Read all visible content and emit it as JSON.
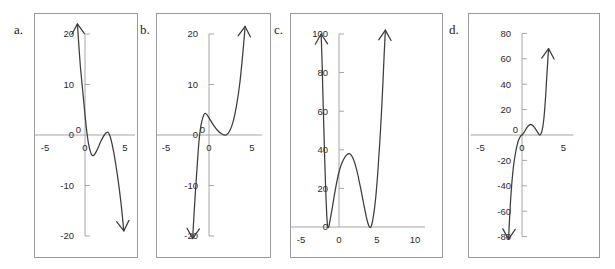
{
  "figure": {
    "background": "#ffffff",
    "curve_color": "#3d3d3d",
    "axis_color": "#a6a6a6",
    "frame_color": "#9a9a9a",
    "ghost_text": ". . . .  .  .   .    .     ."
  },
  "panels": [
    {
      "letter": "a.",
      "name": "panel-a",
      "frame": {
        "x": 34,
        "y": 13,
        "w": 104,
        "h": 245
      },
      "chart_data": {
        "type": "line",
        "title": "",
        "xlabel": "",
        "ylabel": "",
        "xlim": [
          -6.2,
          6.2
        ],
        "ylim": [
          -24,
          24
        ],
        "grid": false,
        "legend": "none",
        "xticks": [
          -5,
          0,
          5
        ],
        "xtick_labels": [
          "-5",
          "0",
          "5"
        ],
        "yticks": [
          20,
          10,
          0,
          -10,
          -20
        ],
        "ytick_labels": [
          "20",
          "10",
          "0",
          "-10",
          "-20"
        ],
        "description": "negative leading coefficient cubic, falling to the right",
        "features": {
          "end_behavior_left": "up",
          "end_behavior_right": "down",
          "local_min": {
            "x": 1.0,
            "y": -4.0
          },
          "local_max": {
            "x": 2.8,
            "y": 0.5
          },
          "roots": [
            0.1,
            2.2,
            3.4
          ]
        },
        "points": [
          {
            "x": -0.95,
            "y": 22.0
          },
          {
            "x": -0.6,
            "y": 14.0
          },
          {
            "x": -0.3,
            "y": 9.0
          },
          {
            "x": 0.0,
            "y": 4.0
          },
          {
            "x": 0.2,
            "y": 1.0
          },
          {
            "x": 0.45,
            "y": -1.8
          },
          {
            "x": 0.8,
            "y": -3.8
          },
          {
            "x": 1.1,
            "y": -4.0
          },
          {
            "x": 1.5,
            "y": -3.0
          },
          {
            "x": 2.0,
            "y": -1.2
          },
          {
            "x": 2.5,
            "y": 0.2
          },
          {
            "x": 2.9,
            "y": 0.5
          },
          {
            "x": 3.2,
            "y": -0.6
          },
          {
            "x": 3.6,
            "y": -3.5
          },
          {
            "x": 4.1,
            "y": -8.5
          },
          {
            "x": 4.5,
            "y": -13.5
          },
          {
            "x": 4.85,
            "y": -19.0
          }
        ]
      }
    },
    {
      "letter": "b.",
      "name": "panel-b",
      "frame": {
        "x": 156,
        "y": 13,
        "w": 115,
        "h": 245
      },
      "chart_data": {
        "type": "line",
        "title": "",
        "xlabel": "",
        "ylabel": "",
        "xlim": [
          -6.2,
          6.2
        ],
        "ylim": [
          -24,
          24
        ],
        "grid": false,
        "legend": "none",
        "xticks": [
          -5,
          0,
          5
        ],
        "xtick_labels": [
          "-5",
          "0",
          "5"
        ],
        "yticks": [
          20,
          10,
          0,
          -10,
          -20
        ],
        "ytick_labels": [
          "20",
          "10",
          "0",
          "-10",
          "-20"
        ],
        "description": "positive leading coefficient cubic, rising to the right",
        "features": {
          "end_behavior_left": "down",
          "end_behavior_right": "up",
          "local_max": {
            "x": -0.4,
            "y": 4.2
          },
          "local_min": {
            "x": 2.0,
            "y": 0.0
          },
          "roots": [
            -1.2,
            2.0
          ]
        },
        "points": [
          {
            "x": -1.9,
            "y": -20.5
          },
          {
            "x": -1.75,
            "y": -16.0
          },
          {
            "x": -1.55,
            "y": -10.5
          },
          {
            "x": -1.35,
            "y": -5.5
          },
          {
            "x": -1.15,
            "y": -1.0
          },
          {
            "x": -0.9,
            "y": 2.2
          },
          {
            "x": -0.6,
            "y": 4.0
          },
          {
            "x": -0.35,
            "y": 4.2
          },
          {
            "x": 0.0,
            "y": 3.4
          },
          {
            "x": 0.5,
            "y": 2.0
          },
          {
            "x": 1.0,
            "y": 0.9
          },
          {
            "x": 1.5,
            "y": 0.2
          },
          {
            "x": 2.0,
            "y": 0.0
          },
          {
            "x": 2.4,
            "y": 0.8
          },
          {
            "x": 2.8,
            "y": 2.6
          },
          {
            "x": 3.2,
            "y": 5.8
          },
          {
            "x": 3.6,
            "y": 10.5
          },
          {
            "x": 3.95,
            "y": 16.5
          },
          {
            "x": 4.2,
            "y": 21.5
          }
        ]
      }
    },
    {
      "letter": "c.",
      "name": "panel-c",
      "frame": {
        "x": 290,
        "y": 13,
        "w": 153,
        "h": 245
      },
      "chart_data": {
        "type": "line",
        "title": "",
        "xlabel": "",
        "ylabel": "",
        "xlim": [
          -6.2,
          11.5
        ],
        "ylim": [
          -6,
          108
        ],
        "grid": false,
        "legend": "none",
        "xticks": [
          -5,
          0,
          5,
          10
        ],
        "xtick_labels": [
          "-5",
          "0",
          "5",
          "10"
        ],
        "yticks": [
          100,
          80,
          60,
          40,
          20,
          0
        ],
        "ytick_labels": [
          "100",
          "80",
          "60",
          "40",
          "20",
          "0"
        ],
        "description": "quartic W shape with two double roots touching the x-axis",
        "features": {
          "end_behavior_left": "up",
          "end_behavior_right": "up",
          "double_root_left": {
            "x": -1.5,
            "y": 0
          },
          "double_root_right": {
            "x": 4.0,
            "y": 0
          },
          "local_max": {
            "x": 1.4,
            "y": 38.0
          }
        },
        "points": [
          {
            "x": -2.35,
            "y": 100.0
          },
          {
            "x": -2.2,
            "y": 82.0
          },
          {
            "x": -2.1,
            "y": 66.0
          },
          {
            "x": -2.0,
            "y": 52.0
          },
          {
            "x": -1.9,
            "y": 38.0
          },
          {
            "x": -1.8,
            "y": 25.0
          },
          {
            "x": -1.7,
            "y": 14.0
          },
          {
            "x": -1.6,
            "y": 5.5
          },
          {
            "x": -1.5,
            "y": 0.3
          },
          {
            "x": -1.35,
            "y": 0.0
          },
          {
            "x": -1.2,
            "y": 3.0
          },
          {
            "x": -0.9,
            "y": 9.5
          },
          {
            "x": -0.5,
            "y": 19.0
          },
          {
            "x": 0.0,
            "y": 28.5
          },
          {
            "x": 0.6,
            "y": 35.0
          },
          {
            "x": 1.3,
            "y": 38.0
          },
          {
            "x": 1.8,
            "y": 36.0
          },
          {
            "x": 2.3,
            "y": 30.0
          },
          {
            "x": 2.8,
            "y": 21.0
          },
          {
            "x": 3.3,
            "y": 11.0
          },
          {
            "x": 3.7,
            "y": 3.5
          },
          {
            "x": 4.0,
            "y": 0.0
          },
          {
            "x": 4.25,
            "y": 0.5
          },
          {
            "x": 4.5,
            "y": 5.0
          },
          {
            "x": 4.8,
            "y": 14.0
          },
          {
            "x": 5.1,
            "y": 28.0
          },
          {
            "x": 5.4,
            "y": 46.0
          },
          {
            "x": 5.7,
            "y": 68.0
          },
          {
            "x": 5.95,
            "y": 90.0
          },
          {
            "x": 6.1,
            "y": 102.0
          }
        ]
      }
    },
    {
      "letter": "d.",
      "name": "panel-d",
      "frame": {
        "x": 468,
        "y": 13,
        "w": 132,
        "h": 245
      },
      "chart_data": {
        "type": "line",
        "title": "",
        "xlabel": "",
        "ylabel": "",
        "xlim": [
          -6.2,
          6.2
        ],
        "ylim": [
          -96,
          96
        ],
        "grid": false,
        "legend": "none",
        "xticks": [
          -5,
          0,
          5
        ],
        "xtick_labels": [
          "-5",
          "0",
          "5"
        ],
        "yticks": [
          80,
          60,
          40,
          20,
          -20,
          -40,
          -60,
          -80
        ],
        "ytick_labels": [
          "80",
          "60",
          "40",
          "20",
          "-20",
          "-40",
          "-60",
          "-80"
        ],
        "description": "odd degree polynomial with flat inflection at origin, rising steeply to the right",
        "features": {
          "end_behavior_left": "down",
          "end_behavior_right": "up",
          "inflection": {
            "x": 0.0,
            "y": 0.0
          },
          "local_max": {
            "x": 1.0,
            "y": 8.0
          },
          "local_min": {
            "x": 2.2,
            "y": 0.0
          },
          "roots": [
            0.0,
            2.2
          ]
        },
        "points": [
          {
            "x": -1.62,
            "y": -82.0
          },
          {
            "x": -1.5,
            "y": -66.0
          },
          {
            "x": -1.38,
            "y": -52.0
          },
          {
            "x": -1.25,
            "y": -40.0
          },
          {
            "x": -1.1,
            "y": -29.0
          },
          {
            "x": -0.95,
            "y": -21.0
          },
          {
            "x": -0.75,
            "y": -13.0
          },
          {
            "x": -0.55,
            "y": -7.0
          },
          {
            "x": -0.35,
            "y": -3.0
          },
          {
            "x": -0.15,
            "y": -0.6
          },
          {
            "x": 0.0,
            "y": 0.0
          },
          {
            "x": 0.25,
            "y": 2.0
          },
          {
            "x": 0.55,
            "y": 5.5
          },
          {
            "x": 0.9,
            "y": 8.0
          },
          {
            "x": 1.2,
            "y": 8.0
          },
          {
            "x": 1.5,
            "y": 6.0
          },
          {
            "x": 1.85,
            "y": 2.5
          },
          {
            "x": 2.15,
            "y": 0.0
          },
          {
            "x": 2.4,
            "y": 3.0
          },
          {
            "x": 2.62,
            "y": 12.0
          },
          {
            "x": 2.8,
            "y": 26.0
          },
          {
            "x": 2.95,
            "y": 42.0
          },
          {
            "x": 3.1,
            "y": 58.0
          },
          {
            "x": 3.2,
            "y": 68.0
          }
        ]
      }
    }
  ]
}
